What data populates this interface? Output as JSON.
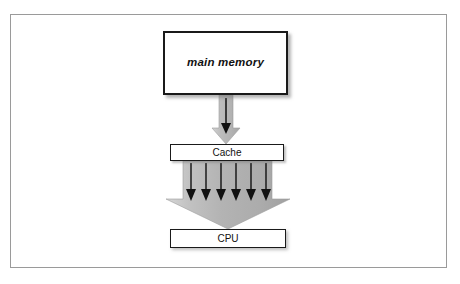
{
  "figure": {
    "type": "block-diagram",
    "background_color": "#ffffff",
    "frame_border_color": "#9a9a9a"
  },
  "nodes": {
    "main_memory": {
      "label": "main memory",
      "style": "bold-italic",
      "border_color": "#1a1a1a",
      "fill_color": "#ffffff"
    },
    "cache": {
      "label": "Cache",
      "style": "regular",
      "border_color": "#1a1a1a",
      "fill_color": "#ffffff"
    },
    "cpu": {
      "label": "CPU",
      "style": "regular",
      "border_color": "#1a1a1a",
      "fill_color": "#ffffff"
    }
  },
  "connectors": {
    "memory_to_cache": {
      "kind": "block-arrow",
      "direction": "down",
      "width_class": "narrow",
      "fill_color": "#b4b4b4",
      "inner_arrow_count": 1,
      "inner_arrow_color": "#111111"
    },
    "cache_to_cpu": {
      "kind": "block-arrow",
      "direction": "down",
      "width_class": "wide-tapering",
      "fill_color": "#b0b0b0",
      "inner_arrow_count": 6,
      "inner_arrow_color": "#111111"
    }
  },
  "colors": {
    "arrow_gray_light": "#c9c9c9",
    "arrow_gray": "#b4b4b4",
    "arrow_gray_dark": "#a2a2a2",
    "ink": "#111111",
    "frame": "#9a9a9a"
  }
}
